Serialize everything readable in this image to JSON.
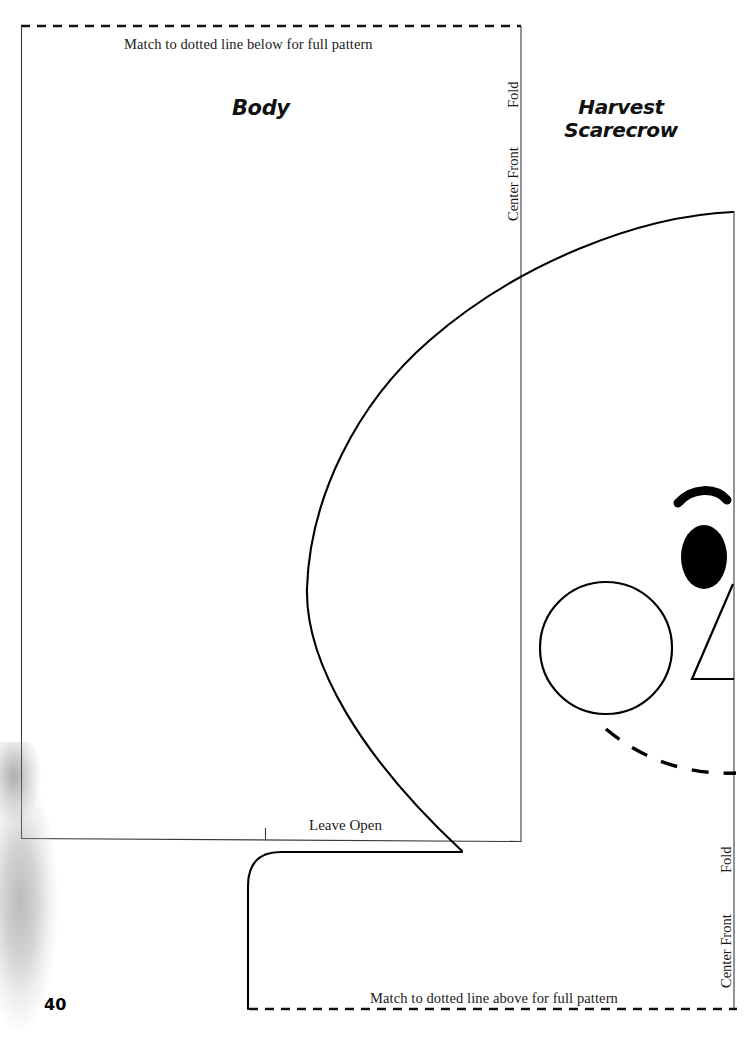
{
  "page": {
    "number": "40",
    "background_color": "#ffffff",
    "ink_color": "#000000",
    "width": 749,
    "height": 1044
  },
  "project": {
    "title_line1": "Harvest",
    "title_line2": "Scarecrow"
  },
  "pattern_pieces": [
    {
      "name": "Body",
      "label": "Body",
      "edge_labels": [
        "Fold",
        "Center Front"
      ],
      "notes": [
        "Match to dotted line below for full pattern",
        "Leave Open"
      ]
    }
  ],
  "labels": {
    "piece_body": "Body",
    "match_above": "Match to dotted line above for full pattern",
    "match_below": "Match to dotted line below for full pattern",
    "leave_open": "Leave Open",
    "fold_top": "Fold",
    "center_front_top": "Center Front",
    "fold_bottom": "Fold",
    "center_front_bottom": "Center Front"
  },
  "markings": {
    "notch": "notch-tick",
    "fold_edge": "fold-line",
    "cut_line": "cut-line",
    "match_line": "dotted-match-line"
  },
  "face_details": {
    "eyebrow": "eyebrow-arc",
    "eye": "eye-filled-oval",
    "nose": "nose-triangle",
    "cheek": "cheek-circle",
    "mouth": "mouth-dashed-curve"
  },
  "artifact": {
    "scan_smudge": "scan-shadow"
  }
}
